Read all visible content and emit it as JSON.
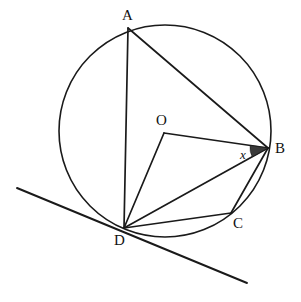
{
  "figure": {
    "width": 301,
    "height": 302,
    "background_color": "#ffffff",
    "stroke_color": "#1a1a1a",
    "shade_color": "#3a3a3a"
  },
  "circle": {
    "name": "main-circle",
    "cx": 165,
    "cy": 131,
    "r": 106
  },
  "points": {
    "A": {
      "label": "A",
      "x": 128,
      "y": 28,
      "label_x": 122,
      "label_y": 20
    },
    "B": {
      "label": "B",
      "x": 268,
      "y": 148,
      "label_x": 275,
      "label_y": 153
    },
    "C": {
      "label": "C",
      "x": 231,
      "y": 213,
      "label_x": 233,
      "label_y": 228
    },
    "D": {
      "label": "D",
      "x": 124,
      "y": 228,
      "label_x": 114,
      "label_y": 245
    },
    "O": {
      "label": "O",
      "x": 164,
      "y": 133,
      "label_x": 156,
      "label_y": 125
    }
  },
  "segments": [
    {
      "name": "chord-AD",
      "from": "A",
      "to": "D",
      "kind": "chord"
    },
    {
      "name": "chord-AB",
      "from": "A",
      "to": "B",
      "kind": "chord"
    },
    {
      "name": "radius-OB",
      "from": "O",
      "to": "B",
      "kind": "radius"
    },
    {
      "name": "radius-OD",
      "from": "O",
      "to": "D",
      "kind": "radius"
    },
    {
      "name": "chord-DB",
      "from": "D",
      "to": "B",
      "kind": "chord"
    },
    {
      "name": "chord-DC",
      "from": "D",
      "to": "C",
      "kind": "chord"
    },
    {
      "name": "chord-BC",
      "from": "B",
      "to": "C",
      "kind": "chord"
    }
  ],
  "tangent": {
    "name": "tangent-line-at-D",
    "x1": 17,
    "y1": 188,
    "x2": 247,
    "y2": 283,
    "touches": "D"
  },
  "angle_marker": {
    "name": "angle-x-at-B",
    "label": "x",
    "vertex": "B",
    "between": [
      "O",
      "D"
    ],
    "label_x": 240,
    "label_y": 159,
    "shaded": true,
    "radius": 18
  }
}
